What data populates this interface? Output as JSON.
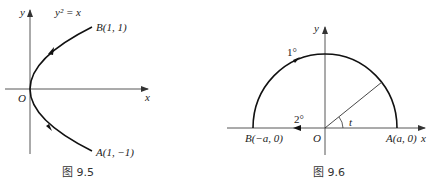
{
  "figures": [
    {
      "caption": "图 9.5",
      "equation": "y² = x",
      "axes": {
        "x_label": "x",
        "y_label": "y",
        "origin_label": "O"
      },
      "points": {
        "B": {
          "label": "B(1, 1)"
        },
        "A": {
          "label": "A(1, −1)"
        }
      },
      "curve": "parabola y² = x from A to B, directed upward"
    },
    {
      "caption": "图 9.6",
      "axes": {
        "x_label": "x",
        "y_label": "y",
        "origin_label": "O"
      },
      "points": {
        "A": {
          "label": "A(a, 0)"
        },
        "B": {
          "label": "B(−a, 0)"
        }
      },
      "path_labels": {
        "upper": "1°",
        "lower": "2°"
      },
      "angle_label": "t",
      "curve": "upper semicircle of radius a from A to B, then segment from O toward B"
    }
  ],
  "colors": {
    "curve": "#111111",
    "axis": "#444444",
    "text": "#222222"
  }
}
